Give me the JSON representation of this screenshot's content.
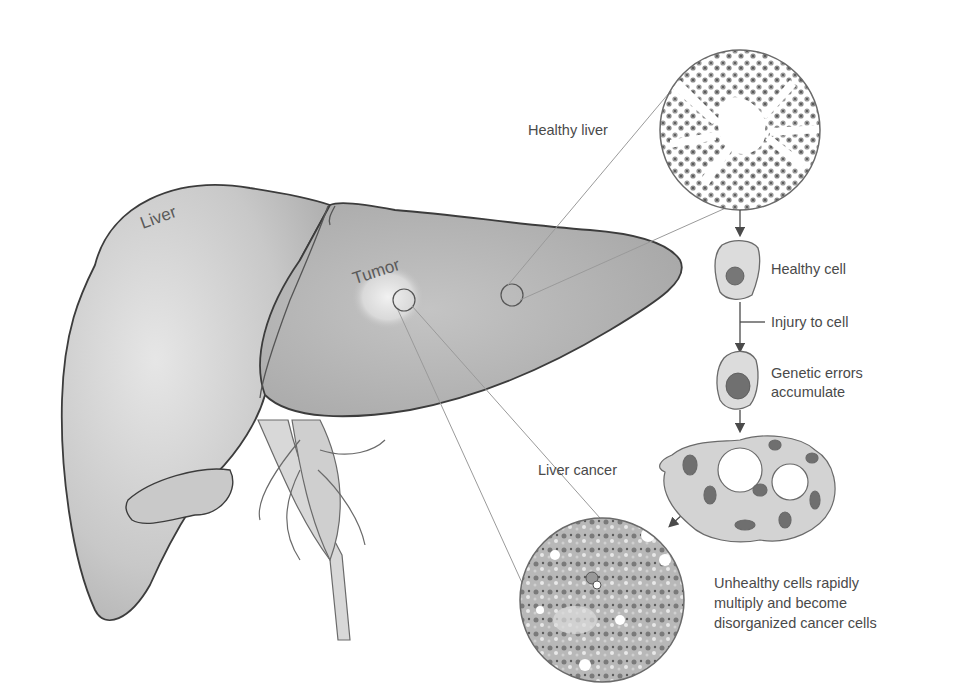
{
  "diagram": {
    "type": "medical-illustration",
    "colors": {
      "background": "#ffffff",
      "outline": "#3c3c3c",
      "liver_fill": "#cfcfcf",
      "liver_shadow": "#a9a9a9",
      "text": "#4a4a4a",
      "leader_line": "#9a9a9a",
      "cell_fill": "#d6d6d6",
      "nucleus": "#6e6e6e"
    },
    "organ_labels": {
      "liver": "Liver",
      "tumor": "Tumor"
    },
    "callouts": {
      "healthy_liver": "Healthy liver",
      "liver_cancer": "Liver cancer"
    },
    "flow_steps": [
      {
        "id": "healthy-cell",
        "label": "Healthy cell"
      },
      {
        "id": "injury",
        "label": "Injury to cell"
      },
      {
        "id": "genetic-errors",
        "label_line1": "Genetic errors",
        "label_line2": "accumulate"
      }
    ],
    "outcome": {
      "line1": "Unhealthy cells rapidly",
      "line2": "multiply and become",
      "line3": "disorganized cancer cells"
    }
  }
}
